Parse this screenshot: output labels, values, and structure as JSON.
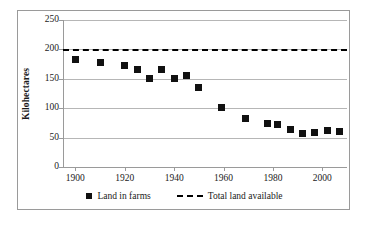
{
  "chart_data": {
    "type": "scatter",
    "title": "",
    "xlabel": "",
    "ylabel": "Kilohectares",
    "xlim": [
      1895,
      2010
    ],
    "ylim": [
      0,
      250
    ],
    "grid": true,
    "legend_position": "bottom",
    "ytick_labels": [
      "250",
      "200",
      "150",
      "100",
      "50",
      "0"
    ],
    "ytick_values": [
      250,
      200,
      150,
      100,
      50,
      0
    ],
    "xtick_labels": [
      "1900",
      "1920",
      "1940",
      "1960",
      "1980",
      "2000"
    ],
    "xtick_values": [
      1900,
      1920,
      1940,
      1960,
      1980,
      2000
    ],
    "series": [
      {
        "name": "Land in farms",
        "marker": "square",
        "color": "#111111",
        "x": [
          1900,
          1910,
          1920,
          1925,
          1930,
          1935,
          1940,
          1945,
          1950,
          1959,
          1969,
          1978,
          1982,
          1987,
          1992,
          1997,
          2002,
          2007
        ],
        "values": [
          183,
          177,
          173,
          165,
          151,
          165,
          151,
          156,
          135,
          101,
          82,
          74,
          72,
          63,
          57,
          59,
          62,
          60
        ]
      },
      {
        "name": "Total land available",
        "marker": "dashed-line",
        "color": "#000000",
        "constant_value": 200
      }
    ],
    "legend": [
      {
        "label": "Land in farms",
        "swatch": "square"
      },
      {
        "label": "Total land available",
        "swatch": "dashed-line"
      }
    ]
  }
}
